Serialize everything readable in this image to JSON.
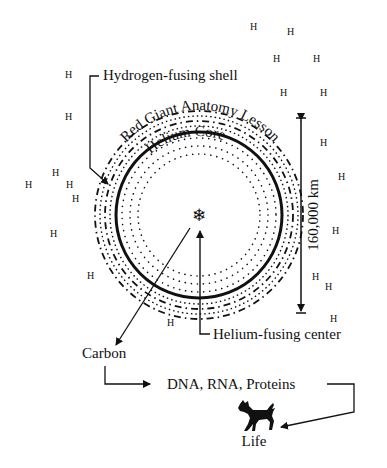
{
  "diagram": {
    "title": "Red Giant Anatomy Lesson",
    "core_label": "Helium Core",
    "shell_label": "Hydrogen-fusing shell",
    "center_label": "Helium-fusing center",
    "diameter_label": "160,000 km",
    "carbon_label": "Carbon",
    "molecules_label": "DNA, RNA, Proteins",
    "life_label": "Life",
    "center_icon": "snowflake-icon",
    "life_icon": "dog-icon",
    "hydrogen_symbol": "H",
    "hydrogen_atoms": [
      {
        "x": 250,
        "y": 30
      },
      {
        "x": 287,
        "y": 35
      },
      {
        "x": 273,
        "y": 62
      },
      {
        "x": 313,
        "y": 62
      },
      {
        "x": 280,
        "y": 96
      },
      {
        "x": 320,
        "y": 96
      },
      {
        "x": 65,
        "y": 78
      },
      {
        "x": 65,
        "y": 120
      },
      {
        "x": 320,
        "y": 146
      },
      {
        "x": 338,
        "y": 180
      },
      {
        "x": 332,
        "y": 234
      },
      {
        "x": 325,
        "y": 290
      },
      {
        "x": 330,
        "y": 322
      },
      {
        "x": 52,
        "y": 176
      },
      {
        "x": 25,
        "y": 188
      },
      {
        "x": 66,
        "y": 188
      },
      {
        "x": 72,
        "y": 202
      },
      {
        "x": 50,
        "y": 237
      },
      {
        "x": 87,
        "y": 279
      },
      {
        "x": 167,
        "y": 326
      },
      {
        "x": 312,
        "y": 280
      }
    ]
  }
}
